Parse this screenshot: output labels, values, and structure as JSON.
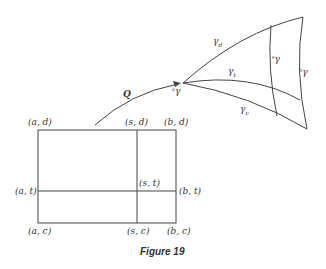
{
  "figure": {
    "caption": "Figure 19",
    "map_label": "Q",
    "rectangle_labels": {
      "top_left": "(a, d)",
      "top_mid": "(s, d)",
      "top_right": "(b, d)",
      "mid_left": "(a, t)",
      "center": "(s, t)",
      "mid_right": "(b, t)",
      "bottom_left": "(a, c)",
      "bottom_mid": "(s, c)",
      "bottom_right": "(b, c)"
    },
    "curve_labels": {
      "gamma_d": "γ",
      "gamma_d_sub": "d",
      "gamma_t": "γ",
      "gamma_t_sub": "t",
      "gamma_c": "γ",
      "gamma_c_sub": "c",
      "a_gamma_pre": "a",
      "a_gamma": "γ",
      "s_gamma_pre": "s",
      "s_gamma": "γ",
      "b_gamma_pre": "b",
      "b_gamma": "γ"
    },
    "stroke_color": "#444444"
  }
}
